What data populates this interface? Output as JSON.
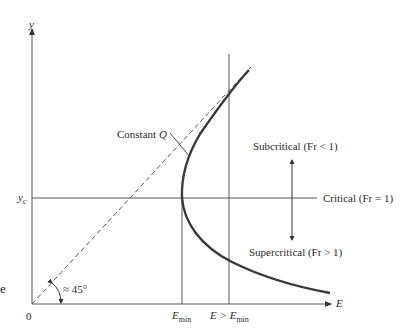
{
  "diagram": {
    "axes": {
      "y_label": "y",
      "x_label": "E",
      "origin_label": "0"
    },
    "labels": {
      "constant_q": "Constant ",
      "constant_q_var": "Q",
      "yc_main": "y",
      "yc_sub": "c",
      "subcritical": "Subcritical (Fr < 1)",
      "critical": "Critical (Fr = 1)",
      "supercritical": "Supercritical (Fr > 1)",
      "angle": "≈ 45°",
      "emin_main": "E",
      "emin_sub": "min",
      "e_gt_emin_prefix": "E > ",
      "e_gt_emin_main": "E",
      "e_gt_emin_sub": "min",
      "edge_fragment": "e"
    },
    "colors": {
      "curve": "#3a3a3a",
      "lines": "#555555",
      "dashed": "#555555"
    }
  }
}
